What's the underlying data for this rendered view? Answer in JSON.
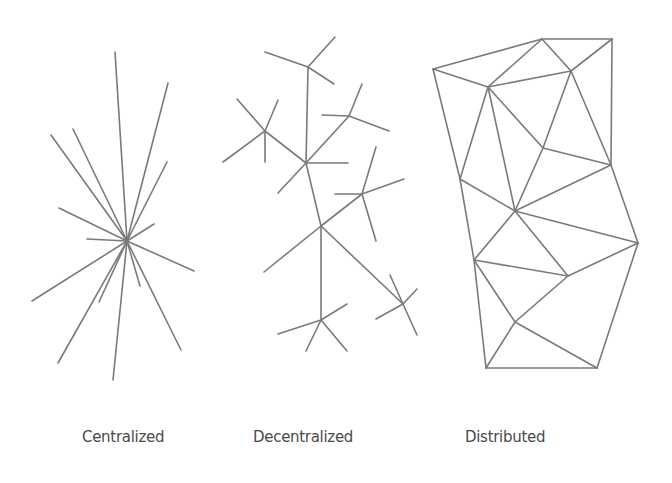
{
  "diagram": {
    "edge_color": "#7a7a7a",
    "panels": [
      {
        "id": "centralized",
        "label": "Centralized",
        "label_x": 82,
        "nodes": {
          "hub": [
            127,
            241
          ]
        },
        "spokes": [
          [
            115,
            52
          ],
          [
            168,
            83
          ],
          [
            51,
            135
          ],
          [
            73,
            129
          ],
          [
            167,
            162
          ],
          [
            59,
            208
          ],
          [
            154,
            224
          ],
          [
            87,
            239
          ],
          [
            194,
            271
          ],
          [
            140,
            286
          ],
          [
            32,
            301
          ],
          [
            99,
            302
          ],
          [
            58,
            363
          ],
          [
            113,
            380
          ],
          [
            181,
            350
          ]
        ]
      },
      {
        "id": "decentralized",
        "label": "Decentralized",
        "label_x": 253,
        "edges": [
          [
            [
              308,
              67
            ],
            [
              335,
              37
            ]
          ],
          [
            [
              308,
              67
            ],
            [
              265,
              52
            ]
          ],
          [
            [
              308,
              67
            ],
            [
              334,
              84
            ]
          ],
          [
            [
              308,
              67
            ],
            [
              306,
              163
            ]
          ],
          [
            [
              265,
              131
            ],
            [
              237,
              99
            ]
          ],
          [
            [
              265,
              131
            ],
            [
              278,
              100
            ]
          ],
          [
            [
              265,
              131
            ],
            [
              223,
              162
            ]
          ],
          [
            [
              265,
              131
            ],
            [
              265,
              162
            ]
          ],
          [
            [
              265,
              131
            ],
            [
              306,
              163
            ]
          ],
          [
            [
              306,
              163
            ],
            [
              348,
              163
            ]
          ],
          [
            [
              306,
              163
            ],
            [
              278,
              193
            ]
          ],
          [
            [
              306,
              163
            ],
            [
              349,
              116
            ]
          ],
          [
            [
              306,
              163
            ],
            [
              321,
              226
            ]
          ],
          [
            [
              349,
              116
            ],
            [
              362,
              84
            ]
          ],
          [
            [
              349,
              116
            ],
            [
              322,
              115
            ]
          ],
          [
            [
              349,
              116
            ],
            [
              389,
              131
            ]
          ],
          [
            [
              321,
              226
            ],
            [
              362,
              194
            ]
          ],
          [
            [
              321,
              226
            ],
            [
              264,
              272
            ]
          ],
          [
            [
              321,
              226
            ],
            [
              321,
              320
            ]
          ],
          [
            [
              321,
              226
            ],
            [
              403,
              304
            ]
          ],
          [
            [
              362,
              194
            ],
            [
              376,
              147
            ]
          ],
          [
            [
              362,
              194
            ],
            [
              335,
              194
            ]
          ],
          [
            [
              362,
              194
            ],
            [
              404,
              179
            ]
          ],
          [
            [
              362,
              194
            ],
            [
              376,
              241
            ]
          ],
          [
            [
              321,
              320
            ],
            [
              278,
              334
            ]
          ],
          [
            [
              321,
              320
            ],
            [
              347,
              304
            ]
          ],
          [
            [
              321,
              320
            ],
            [
              306,
              351
            ]
          ],
          [
            [
              321,
              320
            ],
            [
              347,
              351
            ]
          ],
          [
            [
              403,
              304
            ],
            [
              390,
              275
            ]
          ],
          [
            [
              403,
              304
            ],
            [
              417,
              289
            ]
          ],
          [
            [
              403,
              304
            ],
            [
              376,
              319
            ]
          ],
          [
            [
              403,
              304
            ],
            [
              417,
              335
            ]
          ]
        ]
      },
      {
        "id": "distributed",
        "label": "Distributed",
        "label_x": 465,
        "nodes": {
          "A": [
            433,
            69
          ],
          "B": [
            542,
            39
          ],
          "C": [
            612,
            39
          ],
          "D": [
            488,
            87
          ],
          "E": [
            571,
            71
          ],
          "F": [
            543,
            148
          ],
          "G": [
            611,
            165
          ],
          "H": [
            460,
            179
          ],
          "I": [
            515,
            211
          ],
          "J": [
            474,
            260
          ],
          "K": [
            638,
            243
          ],
          "L": [
            568,
            276
          ],
          "M": [
            515,
            322
          ],
          "N": [
            486,
            368
          ],
          "O": [
            597,
            368
          ]
        },
        "edges": [
          [
            "A",
            "B"
          ],
          [
            "B",
            "C"
          ],
          [
            "A",
            "D"
          ],
          [
            "B",
            "D"
          ],
          [
            "B",
            "E"
          ],
          [
            "C",
            "E"
          ],
          [
            "D",
            "E"
          ],
          [
            "A",
            "H"
          ],
          [
            "D",
            "H"
          ],
          [
            "D",
            "I"
          ],
          [
            "D",
            "F"
          ],
          [
            "E",
            "F"
          ],
          [
            "E",
            "G"
          ],
          [
            "C",
            "G"
          ],
          [
            "F",
            "G"
          ],
          [
            "F",
            "I"
          ],
          [
            "H",
            "I"
          ],
          [
            "G",
            "I"
          ],
          [
            "G",
            "K"
          ],
          [
            "H",
            "J"
          ],
          [
            "I",
            "J"
          ],
          [
            "I",
            "L"
          ],
          [
            "I",
            "K"
          ],
          [
            "J",
            "L"
          ],
          [
            "J",
            "M"
          ],
          [
            "J",
            "N"
          ],
          [
            "L",
            "K"
          ],
          [
            "L",
            "M"
          ],
          [
            "M",
            "O"
          ],
          [
            "M",
            "N"
          ],
          [
            "N",
            "O"
          ],
          [
            "K",
            "O"
          ]
        ]
      }
    ]
  }
}
